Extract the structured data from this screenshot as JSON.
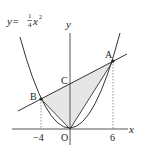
{
  "diagram": {
    "equation": {
      "lhs": "y=",
      "num": "1",
      "den": "4",
      "var": "x",
      "exp": "2"
    },
    "axes": {
      "x_label": "x",
      "y_label": "y",
      "origin_label": "O"
    },
    "points": {
      "A": {
        "label": "A",
        "x": 6,
        "y": 9
      },
      "B": {
        "label": "B",
        "x": -4,
        "y": 4
      },
      "C": {
        "label": "C",
        "x": 0,
        "y": 6
      }
    },
    "ticks": {
      "neg": "−4",
      "pos": "6"
    },
    "shaded_region": "triangle OAB",
    "colors": {
      "line": "#333333",
      "shade": "#e6e6e6",
      "dash": "#666666"
    }
  }
}
